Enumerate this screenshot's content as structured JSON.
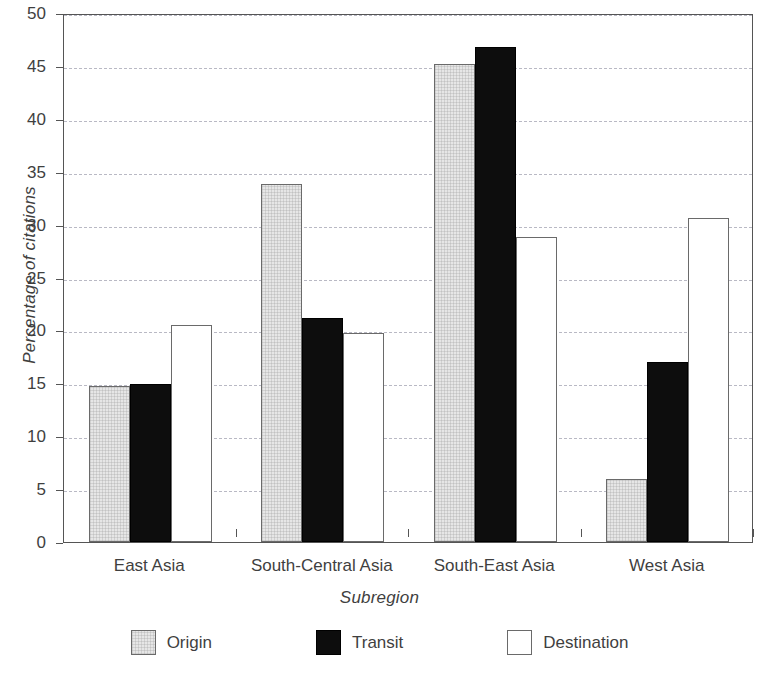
{
  "chart_data": {
    "type": "bar",
    "title": "",
    "xlabel": "Subregion",
    "ylabel": "Percentage of citations",
    "categories": [
      "East Asia",
      "South-Central Asia",
      "South-East Asia",
      "West Asia"
    ],
    "series": [
      {
        "name": "Origin",
        "values": [
          14.7,
          33.8,
          45.2,
          6.0
        ],
        "color": "#e6e6e6"
      },
      {
        "name": "Transit",
        "values": [
          14.9,
          21.2,
          46.8,
          17.0
        ],
        "color": "#0d0d0d"
      },
      {
        "name": "Destination",
        "values": [
          20.5,
          19.8,
          28.8,
          30.6
        ],
        "color": "#ffffff"
      }
    ],
    "ylim": [
      0,
      50
    ],
    "yticks": [
      0,
      5,
      10,
      15,
      20,
      25,
      30,
      35,
      40,
      45,
      50
    ],
    "ytick_labels": [
      "0",
      "5",
      "10",
      "15",
      "20",
      "25",
      "30",
      "35",
      "40",
      "45",
      "50"
    ],
    "grid": true,
    "grid_style": "dashed",
    "legend_position": "bottom"
  },
  "legend": {
    "items": [
      {
        "label": "Origin"
      },
      {
        "label": "Transit"
      },
      {
        "label": "Destination"
      }
    ]
  }
}
